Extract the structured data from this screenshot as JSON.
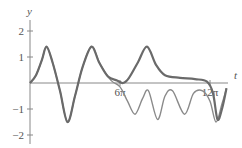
{
  "chart_data": {
    "type": "line",
    "title": "",
    "xlabel": "t",
    "ylabel": "y",
    "x_ticks": [
      {
        "value": "6π",
        "label": "6π"
      },
      {
        "value": "12π",
        "label": "12π"
      }
    ],
    "y_ticks": [
      {
        "value": 2,
        "label": "2"
      },
      {
        "value": 1,
        "label": "1"
      },
      {
        "value": -1,
        "label": "−1"
      },
      {
        "value": -2,
        "label": "−2"
      }
    ],
    "xlim_pi": [
      0,
      13.5
    ],
    "ylim": [
      -2.2,
      2.2
    ],
    "grid": false,
    "legend": null,
    "series": [
      {
        "name": "solution-1",
        "color": "#6a6a6a",
        "width": 2.2,
        "points_t_over_pi_y": [
          [
            0,
            0
          ],
          [
            0.4,
            0.3
          ],
          [
            0.8,
            0.9
          ],
          [
            1.1,
            1.4
          ],
          [
            1.5,
            0.8
          ],
          [
            2.0,
            -0.3
          ],
          [
            2.5,
            -1.5
          ],
          [
            3.0,
            -0.5
          ],
          [
            3.5,
            0.6
          ],
          [
            4.1,
            1.4
          ],
          [
            4.6,
            0.8
          ],
          [
            5.2,
            0.25
          ],
          [
            5.8,
            0.1
          ],
          [
            6.2,
            0.0
          ],
          [
            6.6,
            0.2
          ],
          [
            7.2,
            0.8
          ],
          [
            7.8,
            1.4
          ],
          [
            8.4,
            0.7
          ],
          [
            9.0,
            0.3
          ],
          [
            10,
            0.2
          ],
          [
            11,
            0.15
          ],
          [
            11.8,
            0.05
          ],
          [
            12.2,
            -0.4
          ],
          [
            12.5,
            -1.4
          ],
          [
            12.8,
            -1.0
          ],
          [
            13.1,
            -0.2
          ]
        ]
      },
      {
        "name": "solution-2",
        "color": "#8a8a8a",
        "width": 1.4,
        "points_t_over_pi_y": [
          [
            0,
            0
          ],
          [
            0.4,
            0.3
          ],
          [
            0.8,
            0.9
          ],
          [
            1.1,
            1.4
          ],
          [
            1.5,
            0.8
          ],
          [
            2.0,
            -0.3
          ],
          [
            2.5,
            -1.5
          ],
          [
            3.0,
            -0.5
          ],
          [
            3.5,
            0.6
          ],
          [
            4.1,
            1.4
          ],
          [
            4.7,
            0.7
          ],
          [
            5.4,
            0.1
          ],
          [
            6.0,
            -0.15
          ],
          [
            6.5,
            -0.7
          ],
          [
            7.0,
            -1.2
          ],
          [
            7.5,
            -0.6
          ],
          [
            7.9,
            -0.3
          ],
          [
            8.5,
            -1.4
          ],
          [
            9.0,
            -0.5
          ],
          [
            9.5,
            -0.3
          ],
          [
            10.3,
            -1.2
          ],
          [
            10.9,
            -0.4
          ],
          [
            11.5,
            -0.3
          ],
          [
            12.0,
            -0.7
          ],
          [
            12.4,
            -1.5
          ],
          [
            12.8,
            -0.8
          ],
          [
            13.1,
            -0.2
          ]
        ]
      }
    ]
  },
  "axes": {
    "x_label": "t",
    "y_label": "y",
    "x_tick_labels": [
      "6π",
      "12π"
    ],
    "y_tick_labels": [
      "2",
      "1",
      "−1",
      "−2"
    ]
  }
}
